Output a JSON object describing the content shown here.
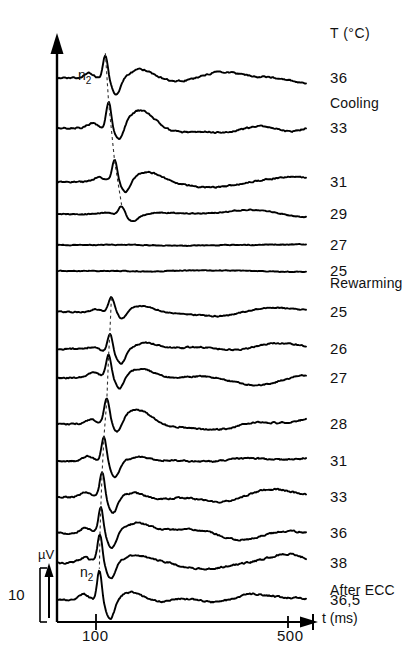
{
  "figure": {
    "header": {
      "temperature_header": "T (°C)"
    },
    "axes": {
      "x": {
        "label": "t (ms)",
        "ticks": [
          {
            "value": 100,
            "label": "100",
            "px": 96
          },
          {
            "value": 500,
            "label": "500",
            "px": 288
          }
        ],
        "range_ms": [
          0,
          540
        ],
        "origin_px": 57,
        "arrow": true
      },
      "y": {
        "label": "µV",
        "scale_bar_value": "10",
        "arrow": true
      }
    },
    "phases": [
      {
        "name": "Cooling",
        "label": "Cooling",
        "y": 103
      },
      {
        "name": "Rewarming",
        "label": "Rewarming",
        "y": 283
      },
      {
        "name": "After ECC",
        "label": "After ECC",
        "y": 590
      }
    ],
    "peak_annotations": [
      {
        "label": "n",
        "subscript": "2",
        "x": 78,
        "y": 68
      },
      {
        "label": "n",
        "subscript": "2",
        "x": 80,
        "y": 565
      }
    ],
    "traces": [
      {
        "id": "t36c",
        "temp_label": "36",
        "phase": "Cooling",
        "baseline_y": 78
      },
      {
        "id": "t33c",
        "temp_label": "33",
        "phase": "Cooling",
        "baseline_y": 128
      },
      {
        "id": "t31c",
        "temp_label": "31",
        "phase": "Cooling",
        "baseline_y": 182
      },
      {
        "id": "t29c",
        "temp_label": "29",
        "phase": "Cooling",
        "baseline_y": 214
      },
      {
        "id": "t27c",
        "temp_label": "27",
        "phase": "Cooling",
        "baseline_y": 245
      },
      {
        "id": "t25c",
        "temp_label": "25",
        "phase": "Cooling",
        "baseline_y": 271
      },
      {
        "id": "t25r",
        "temp_label": "25",
        "phase": "Rewarming",
        "baseline_y": 312
      },
      {
        "id": "t26r",
        "temp_label": "26",
        "phase": "Rewarming",
        "baseline_y": 349
      },
      {
        "id": "t27r",
        "temp_label": "27",
        "phase": "Rewarming",
        "baseline_y": 378
      },
      {
        "id": "t28r",
        "temp_label": "28",
        "phase": "Rewarming",
        "baseline_y": 424
      },
      {
        "id": "t31r",
        "temp_label": "31",
        "phase": "Rewarming",
        "baseline_y": 461
      },
      {
        "id": "t33r",
        "temp_label": "33",
        "phase": "Rewarming",
        "baseline_y": 497
      },
      {
        "id": "t36r",
        "temp_label": "36",
        "phase": "Rewarming",
        "baseline_y": 533
      },
      {
        "id": "t38r",
        "temp_label": "38",
        "phase": "Rewarming",
        "baseline_y": 563
      },
      {
        "id": "t365e",
        "temp_label": "36,5",
        "phase": "After ECC",
        "baseline_y": 600
      }
    ]
  },
  "chart_data": {
    "type": "line",
    "title": "",
    "subtitle": "",
    "xlabel": "t (ms)",
    "ylabel": "µV",
    "xlim": [
      0,
      540
    ],
    "xticks": [
      100,
      500
    ],
    "xticklabels": [
      "100",
      "500"
    ],
    "grid": false,
    "legend_position": "right",
    "scale_bar": {
      "value": 10,
      "unit": "µV"
    },
    "annotations": [
      "n2",
      "n2",
      "Cooling",
      "Rewarming",
      "After ECC",
      "T (°C)"
    ],
    "series": [
      {
        "name": "36",
        "phase": "Cooling",
        "legend": "36",
        "amplitude": 0.95,
        "latency_ms": 105
      },
      {
        "name": "33",
        "phase": "Cooling",
        "legend": "33",
        "amplitude": 1.0,
        "latency_ms": 112
      },
      {
        "name": "31",
        "phase": "Cooling",
        "legend": "31",
        "amplitude": 0.8,
        "latency_ms": 125
      },
      {
        "name": "29",
        "phase": "Cooling",
        "legend": "29",
        "amplitude": 0.35,
        "latency_ms": 140
      },
      {
        "name": "27",
        "phase": "Cooling",
        "legend": "27",
        "amplitude": 0.12,
        "latency_ms": 0
      },
      {
        "name": "25",
        "phase": "Cooling",
        "legend": "25",
        "amplitude": 0.05,
        "latency_ms": 0
      },
      {
        "name": "25",
        "phase": "Rewarming",
        "legend": "25",
        "amplitude": 0.55,
        "latency_ms": 118
      },
      {
        "name": "26",
        "phase": "Rewarming",
        "legend": "26",
        "amplitude": 0.75,
        "latency_ms": 115
      },
      {
        "name": "27",
        "phase": "Rewarming",
        "legend": "27",
        "amplitude": 0.85,
        "latency_ms": 112
      },
      {
        "name": "28",
        "phase": "Rewarming",
        "legend": "28",
        "amplitude": 0.9,
        "latency_ms": 108
      },
      {
        "name": "31",
        "phase": "Rewarming",
        "legend": "31",
        "amplitude": 0.95,
        "latency_ms": 102
      },
      {
        "name": "33",
        "phase": "Rewarming",
        "legend": "33",
        "amplitude": 1.0,
        "latency_ms": 98
      },
      {
        "name": "36",
        "phase": "Rewarming",
        "legend": "36",
        "amplitude": 1.0,
        "latency_ms": 95
      },
      {
        "name": "38",
        "phase": "Rewarming",
        "legend": "38",
        "amplitude": 1.05,
        "latency_ms": 93
      },
      {
        "name": "36,5",
        "phase": "After ECC",
        "legend": "36,5",
        "amplitude": 1.2,
        "latency_ms": 92
      }
    ]
  }
}
